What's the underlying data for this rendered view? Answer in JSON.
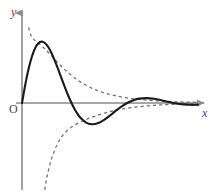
{
  "figure": {
    "axis_label_y": "y",
    "axis_label_x": "x",
    "origin_label": "O",
    "axis_color": "#8a8a8a",
    "curve_color": "#1a1a1a",
    "envelope_color": "#6e6e6e",
    "background_color": "#ffffff"
  },
  "chart_data": {
    "type": "line",
    "title": "",
    "subtitle": "",
    "xlabel": "x",
    "ylabel": "y",
    "grid": false,
    "legend_position": "none",
    "axis_origin_label": "O",
    "xlim": [
      0,
      12
    ],
    "ylim": [
      -6,
      6
    ],
    "series": [
      {
        "name": "damped-oscillation",
        "style": "solid",
        "color": "#1a1a1a",
        "x": [
          0.0,
          0.2,
          0.4,
          0.6,
          0.8,
          1.0,
          1.2,
          1.4,
          1.6,
          1.8,
          2.0,
          2.2,
          2.4,
          2.6,
          2.8,
          3.0,
          3.2,
          3.4,
          3.6,
          3.8,
          4.0,
          4.4,
          4.8,
          5.2,
          5.6,
          6.0,
          6.4,
          6.8,
          7.2,
          7.6,
          8.0,
          8.5,
          9.0,
          9.5,
          10.0,
          10.5,
          11.0,
          11.5,
          12.0
        ],
        "y": [
          0.0,
          1.18,
          2.21,
          3.05,
          3.69,
          4.12,
          4.34,
          4.38,
          4.25,
          3.98,
          3.59,
          3.12,
          2.59,
          2.03,
          1.47,
          0.92,
          0.41,
          -0.05,
          -0.46,
          -0.8,
          -1.08,
          -1.42,
          -1.52,
          -1.43,
          -1.2,
          -0.89,
          -0.55,
          -0.24,
          0.02,
          0.2,
          0.31,
          0.35,
          0.3,
          0.2,
          0.08,
          -0.03,
          -0.1,
          -0.13,
          -0.12
        ]
      },
      {
        "name": "upper-envelope",
        "style": "dashed",
        "color": "#6e6e6e",
        "x": [
          0.45,
          0.6,
          0.8,
          1.0,
          1.3,
          1.6,
          2.0,
          2.4,
          2.8,
          3.2,
          3.6,
          4.0,
          4.5,
          5.0,
          5.5,
          6.0,
          6.5,
          7.0,
          7.5,
          8.0,
          8.5,
          9.0,
          9.5,
          10.0,
          10.5,
          11.0,
          11.5,
          12.0
        ],
        "y": [
          5.4,
          4.85,
          4.55,
          4.38,
          4.12,
          3.82,
          3.38,
          2.93,
          2.5,
          2.12,
          1.78,
          1.49,
          1.19,
          0.95,
          0.76,
          0.61,
          0.49,
          0.39,
          0.31,
          0.25,
          0.2,
          0.16,
          0.13,
          0.1,
          0.08,
          0.07,
          0.06,
          0.05
        ]
      },
      {
        "name": "lower-envelope",
        "style": "dashed",
        "color": "#6e6e6e",
        "x": [
          1.55,
          1.7,
          1.9,
          2.1,
          2.4,
          2.7,
          3.0,
          3.4,
          3.8,
          4.2,
          4.6,
          5.0,
          5.5,
          6.0,
          6.5,
          7.0,
          7.5,
          8.0,
          8.5,
          9.0,
          9.5,
          10.0,
          10.5,
          11.0,
          11.5,
          12.0
        ],
        "y": [
          -6.2,
          -5.3,
          -4.4,
          -3.72,
          -2.95,
          -2.42,
          -2.05,
          -1.7,
          -1.45,
          -1.25,
          -1.08,
          -0.93,
          -0.76,
          -0.62,
          -0.5,
          -0.4,
          -0.32,
          -0.26,
          -0.21,
          -0.17,
          -0.13,
          -0.11,
          -0.09,
          -0.07,
          -0.06,
          -0.05
        ]
      }
    ]
  }
}
